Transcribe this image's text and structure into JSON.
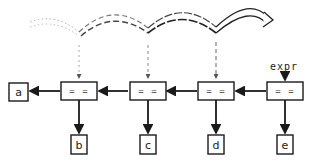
{
  "diagram": {
    "type": "expression-tree-chain",
    "label_expr": "expr",
    "operator_nodes": [
      {
        "label": "= =",
        "rhs": "b"
      },
      {
        "label": "= =",
        "rhs": "c"
      },
      {
        "label": "= =",
        "rhs": "d"
      },
      {
        "label": "= =",
        "rhs": "e"
      }
    ],
    "leftmost_leaf": "a",
    "leaves": [
      "a",
      "b",
      "c",
      "d",
      "e"
    ],
    "arc_style_sequence": [
      "dotted",
      "dashed",
      "dashed-bold",
      "solid-hollow"
    ],
    "colors": {
      "ink": "#1a1a1a",
      "background": "#ffffff"
    }
  }
}
